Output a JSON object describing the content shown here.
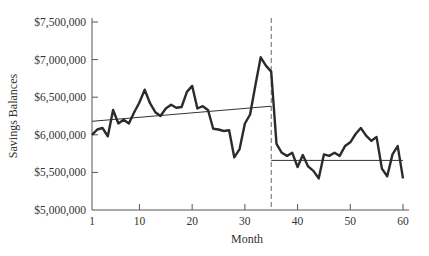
{
  "chart_data": {
    "type": "line",
    "title": "",
    "xlabel": "Month",
    "ylabel": "Savings Balances",
    "xlim": [
      1,
      60
    ],
    "ylim": [
      5000000,
      7500000
    ],
    "x_ticks": [
      1,
      10,
      20,
      30,
      40,
      50,
      60
    ],
    "y_ticks": [
      5000000,
      5500000,
      6000000,
      6500000,
      7000000,
      7500000
    ],
    "y_tick_labels": [
      "$5,000,000",
      "$5,500,000",
      "$6,000,000",
      "$6,500,000",
      "$7,000,000",
      "$7,500,000"
    ],
    "grid": false,
    "legend": null,
    "series": [
      {
        "name": "Savings Balances",
        "style": "solid-thick",
        "x": [
          1,
          2,
          3,
          4,
          5,
          6,
          7,
          8,
          9,
          10,
          11,
          12,
          13,
          14,
          15,
          16,
          17,
          18,
          19,
          20,
          21,
          22,
          23,
          24,
          25,
          26,
          27,
          28,
          29,
          30,
          31,
          32,
          33,
          34,
          35,
          36,
          37,
          38,
          39,
          40,
          41,
          42,
          43,
          44,
          45,
          46,
          47,
          48,
          49,
          50,
          51,
          52,
          53,
          54,
          55,
          56,
          57,
          58,
          59,
          60
        ],
        "values": [
          6000000,
          6070000,
          6090000,
          5980000,
          6330000,
          6150000,
          6200000,
          6150000,
          6300000,
          6430000,
          6600000,
          6420000,
          6300000,
          6250000,
          6350000,
          6400000,
          6360000,
          6370000,
          6570000,
          6650000,
          6350000,
          6380000,
          6330000,
          6080000,
          6070000,
          6050000,
          6060000,
          5700000,
          5810000,
          6150000,
          6270000,
          6660000,
          7030000,
          6920000,
          6840000,
          5880000,
          5760000,
          5720000,
          5760000,
          5570000,
          5730000,
          5580000,
          5520000,
          5420000,
          5740000,
          5720000,
          5760000,
          5720000,
          5850000,
          5900000,
          6010000,
          6090000,
          5990000,
          5920000,
          5970000,
          5550000,
          5450000,
          5740000,
          5850000,
          5420000
        ]
      },
      {
        "name": "Pre-intervention trend",
        "style": "solid-thin",
        "x": [
          1,
          35
        ],
        "values": [
          6180000,
          6380000
        ]
      },
      {
        "name": "Post-intervention level",
        "style": "solid-thin",
        "x": [
          35,
          60
        ],
        "values": [
          5660000,
          5660000
        ]
      }
    ],
    "annotations": [
      {
        "type": "vertical-dashed-line",
        "x": 35,
        "label": ""
      }
    ]
  }
}
